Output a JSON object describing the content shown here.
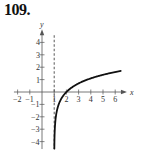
{
  "problem_number": "109.",
  "chart_data": {
    "type": "line",
    "title": "",
    "xlabel": "x",
    "ylabel": "y",
    "xlim": [
      -2.3,
      6.8
    ],
    "ylim": [
      -4.6,
      4.9
    ],
    "x_ticks": [
      -2,
      -1,
      1,
      2,
      3,
      4,
      5,
      6
    ],
    "y_ticks": [
      -4,
      -3,
      -2,
      -1,
      1,
      2,
      3,
      4
    ],
    "grid": false,
    "asymptote": {
      "type": "vertical",
      "x": 1,
      "style": "dashed"
    },
    "series": [
      {
        "name": "y = ln(x - 1)",
        "x": [
          1.01,
          1.05,
          1.1,
          1.2,
          1.5,
          2,
          3,
          4,
          5,
          6,
          6.5
        ],
        "y": [
          -4.6,
          -3.0,
          -2.3,
          -1.61,
          -0.69,
          0,
          0.69,
          1.1,
          1.39,
          1.61,
          1.7
        ]
      }
    ],
    "colors": {
      "curve": "#111111",
      "axes": "#555555"
    }
  }
}
